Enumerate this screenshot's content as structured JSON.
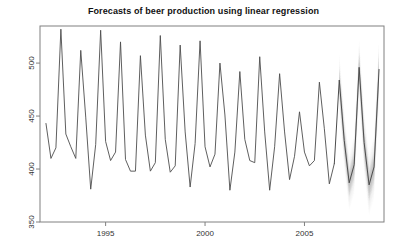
{
  "chart_data": {
    "type": "line",
    "title": "Forecasts of beer production using linear regression",
    "xlabel": "",
    "ylabel": "",
    "xlim": [
      1991.7,
      2009.0
    ],
    "ylim": [
      350,
      535
    ],
    "grid": false,
    "legend": null,
    "x_ticks": [
      1995,
      2000,
      2005
    ],
    "x_tick_labels": [
      "1995",
      "2000",
      "2005"
    ],
    "y_ticks": [
      350,
      400,
      450,
      500
    ],
    "y_tick_labels": [
      "350",
      "400",
      "450",
      "500"
    ],
    "colors": {
      "historical_line": "#4d4d4d",
      "forecast_line": "#4d4d4d",
      "interval_80": "#b0b0b0",
      "interval_95": "#d9d9d9",
      "axis": "#808080",
      "title": "#111111"
    },
    "series": [
      {
        "name": "Observed quarterly beer production",
        "type": "historical",
        "x": [
          1992.0,
          1992.25,
          1992.5,
          1992.75,
          1993.0,
          1993.25,
          1993.5,
          1993.75,
          1994.0,
          1994.25,
          1994.5,
          1994.75,
          1995.0,
          1995.25,
          1995.5,
          1995.75,
          1996.0,
          1996.25,
          1996.5,
          1996.75,
          1997.0,
          1997.25,
          1997.5,
          1997.75,
          1998.0,
          1998.25,
          1998.5,
          1998.75,
          1999.0,
          1999.25,
          1999.5,
          1999.75,
          2000.0,
          2000.25,
          2000.5,
          2000.75,
          2001.0,
          2001.25,
          2001.5,
          2001.75,
          2002.0,
          2002.25,
          2002.5,
          2002.75,
          2003.0,
          2003.25,
          2003.5,
          2003.75,
          2004.0,
          2004.25,
          2004.5,
          2004.75,
          2005.0,
          2005.25,
          2005.5,
          2005.75,
          2006.0,
          2006.25,
          2006.5
        ],
        "y": [
          443,
          410,
          420,
          532,
          433,
          421,
          410,
          512,
          449,
          381,
          423,
          531,
          426,
          408,
          416,
          520,
          409,
          398,
          398,
          507,
          432,
          398,
          406,
          526,
          428,
          397,
          403,
          517,
          435,
          383,
          424,
          521,
          421,
          402,
          414,
          500,
          451,
          380,
          416,
          492,
          428,
          408,
          406,
          506,
          435,
          380,
          421,
          490,
          435,
          390,
          412,
          454,
          416,
          403,
          408,
          482,
          438,
          386,
          405
        ]
      },
      {
        "name": "Point forecast (linear regression)",
        "type": "forecast",
        "x": [
          2006.75,
          2007.0,
          2007.25,
          2007.5,
          2007.75,
          2008.0,
          2008.25,
          2008.5,
          2008.75
        ],
        "y": [
          484,
          427,
          387,
          404,
          496,
          425,
          385,
          402,
          494
        ]
      }
    ],
    "prediction_intervals": [
      {
        "level": 80,
        "x": [
          2006.75,
          2007.0,
          2007.25,
          2007.5,
          2007.75,
          2008.0,
          2008.25,
          2008.5,
          2008.75
        ],
        "lower": [
          470,
          413,
          373,
          389,
          481,
          409,
          369,
          386,
          477
        ],
        "upper": [
          498,
          441,
          401,
          419,
          511,
          441,
          401,
          418,
          511
        ]
      },
      {
        "level": 95,
        "x": [
          2006.75,
          2007.0,
          2007.25,
          2007.5,
          2007.75,
          2008.0,
          2008.25,
          2008.5,
          2008.75
        ],
        "lower": [
          458,
          401,
          361,
          377,
          469,
          396,
          356,
          373,
          464
        ],
        "upper": [
          510,
          453,
          413,
          431,
          523,
          454,
          414,
          431,
          524
        ]
      }
    ]
  }
}
